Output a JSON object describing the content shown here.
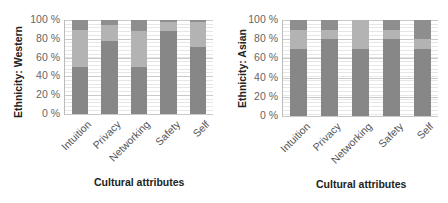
{
  "colors": {
    "seg_bottom": "#878787",
    "seg_middle": "#b3b3b3",
    "seg_top": "#8e8e8e"
  },
  "chart_data": [
    {
      "type": "bar",
      "stacked": true,
      "title": "",
      "ylabel": "Ethnicity: Western",
      "xlabel": "Cultural attributes",
      "ylim": [
        0,
        100
      ],
      "yticks": [
        "0 %",
        "20 %",
        "40 %",
        "60 %",
        "80 %",
        "100 %"
      ],
      "categories": [
        "Intuition",
        "Privacy",
        "Networking",
        "Safety",
        "Self"
      ],
      "series": [
        {
          "name": "bottom",
          "values": [
            50,
            78,
            50,
            88,
            71
          ]
        },
        {
          "name": "middle",
          "values": [
            39,
            17,
            38,
            10,
            27
          ]
        },
        {
          "name": "top",
          "values": [
            11,
            5,
            12,
            2,
            2
          ]
        }
      ],
      "grid": true,
      "legend": "none"
    },
    {
      "type": "bar",
      "stacked": true,
      "title": "",
      "ylabel": "Ethnicity: Asian",
      "xlabel": "Cultural attributes",
      "ylim": [
        0,
        100
      ],
      "yticks": [
        "0 %",
        "20 %",
        "40 %",
        "60 %",
        "80 %",
        "100 %"
      ],
      "categories": [
        "Intuition",
        "Privacy",
        "Networking",
        "Safety",
        "Self"
      ],
      "series": [
        {
          "name": "bottom",
          "values": [
            70,
            80,
            70,
            80,
            70
          ]
        },
        {
          "name": "middle",
          "values": [
            20,
            10,
            30,
            10,
            10
          ]
        },
        {
          "name": "top",
          "values": [
            10,
            10,
            0,
            10,
            20
          ]
        }
      ],
      "grid": true,
      "legend": "none"
    }
  ]
}
